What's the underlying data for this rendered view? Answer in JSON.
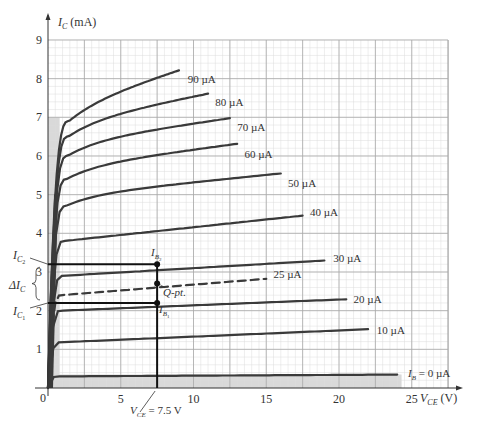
{
  "chart_data": {
    "type": "line",
    "title": "",
    "xlabel": "V_CE (V)",
    "ylabel": "I_C (mA)",
    "xlim": [
      0,
      27.5
    ],
    "ylim": [
      0,
      9
    ],
    "grid": true,
    "x_ticks": [
      0,
      5,
      10,
      15,
      20,
      25
    ],
    "y_ticks": [
      1,
      2,
      3,
      4,
      5,
      6,
      7,
      8,
      9
    ],
    "series": [
      {
        "name": "I_B = 0 µA",
        "label": "I_B = 0 µA",
        "sat": 0.35,
        "end_v": 24.0,
        "slope": 0.002,
        "start_ic": 0.3,
        "label_pos": [
          25.4,
          0.36
        ]
      },
      {
        "name": "10 µA",
        "label": "10 µA",
        "sat": 1.2,
        "end_v": 22.0,
        "slope": 0.016,
        "start_ic": 1.18,
        "label_pos": [
          22.6,
          1.5
        ]
      },
      {
        "name": "20 µA",
        "label": "20 µA",
        "sat": 2.05,
        "end_v": 20.5,
        "slope": 0.015,
        "start_ic": 2.0,
        "label_pos": [
          21.0,
          2.3
        ]
      },
      {
        "name": "25 µA",
        "label": "25 µA",
        "sat": 2.5,
        "end_v": 15.0,
        "slope": 0.03,
        "start_ic": 2.4,
        "dashed": true,
        "label_pos": [
          15.5,
          2.95
        ]
      },
      {
        "name": "30 µA",
        "label": "30 µA",
        "sat": 2.95,
        "end_v": 19.0,
        "slope": 0.022,
        "start_ic": 2.9,
        "label_pos": [
          19.6,
          3.35
        ]
      },
      {
        "name": "40 µA",
        "label": "40 µA",
        "sat": 3.85,
        "end_v": 17.5,
        "slope": 0.04,
        "start_ic": 3.8,
        "label_pos": [
          18.0,
          4.55
        ]
      },
      {
        "name": "50 µA",
        "label": "50 µA",
        "sat": 4.75,
        "end_v": 16.0,
        "slope": 0.038,
        "start_ic": 4.7,
        "label_pos": [
          16.5,
          5.3
        ]
      },
      {
        "name": "60 µA",
        "label": "60 µA",
        "sat": 5.5,
        "end_v": 13.0,
        "slope": 0.05,
        "start_ic": 5.4,
        "label_pos": [
          13.5,
          6.05
        ]
      },
      {
        "name": "70 µA",
        "label": "70 µA",
        "sat": 6.1,
        "end_v": 12.5,
        "slope": 0.055,
        "start_ic": 6.0,
        "label_pos": [
          13.0,
          6.75
        ]
      },
      {
        "name": "80 µA",
        "label": "80 µA",
        "sat": 6.6,
        "end_v": 11.0,
        "slope": 0.075,
        "start_ic": 6.5,
        "label_pos": [
          11.5,
          7.4
        ]
      },
      {
        "name": "90 µA",
        "label": "90 µA",
        "sat": 7.0,
        "end_v": 9.0,
        "slope": 0.12,
        "start_ic": 6.9,
        "label_pos": [
          9.6,
          8.0
        ]
      }
    ],
    "annotations": {
      "vce_line": {
        "v": 7.5,
        "label": "V_CE = 7.5 V"
      },
      "ic2": {
        "ic": 3.2,
        "label": "I_C2"
      },
      "ic1": {
        "ic": 2.2,
        "label": "I_C1"
      },
      "q_point": {
        "v": 7.5,
        "ic": 2.7,
        "label": "Q-pt."
      },
      "ib2_label": "I_B2",
      "ib1_label": "I_B1",
      "delta_ic_label": "ΔI_C",
      "delta_ic": 1.0
    }
  },
  "labels": {
    "y_axis": "I",
    "y_axis_sub": "C",
    "y_axis_unit": " (mA)",
    "x_axis": "V",
    "x_axis_sub": "CE",
    "x_axis_unit": " (V)",
    "origin": "0",
    "vce_annot": "V",
    "vce_annot_sub": "CE",
    "vce_annot_rest": " = 7.5 V",
    "ib0_main": "I",
    "ib0_sub": "B",
    "ib0_rest": " = 0 µA",
    "ic2_main": "I",
    "ic2_sub": "C",
    "ic2_subsub": "2",
    "ic1_main": "I",
    "ic1_sub": "C",
    "ic1_subsub": "1",
    "ib2_main": "I",
    "ib2_sub": "B",
    "ib2_subsub": "2",
    "ib1_main": "I",
    "ib1_sub": "B",
    "ib1_subsub": "1",
    "delta_main": "ΔI",
    "delta_sub": "C",
    "qpt": "Q-pt."
  },
  "colors": {
    "curve": "#3a3a3a",
    "grid_major": "#a8a8a8",
    "grid_minor": "#dcdcdc",
    "shade": "#d9d9d9",
    "axis": "#333333",
    "text": "#333333"
  }
}
